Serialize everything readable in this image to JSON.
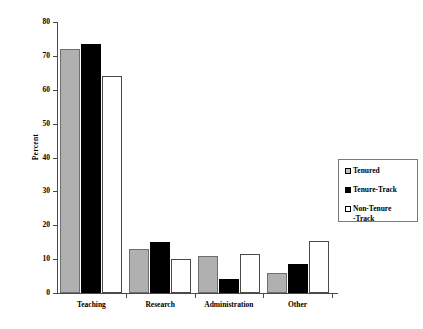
{
  "chart_data": {
    "type": "bar",
    "title": "",
    "xlabel": "",
    "ylabel": "Percent",
    "ylim": [
      0,
      80
    ],
    "yticks": [
      0,
      10,
      20,
      30,
      40,
      50,
      60,
      70,
      80
    ],
    "ytick_labels": [
      "0",
      "10",
      "20",
      "30",
      "40",
      "50",
      "60",
      "70",
      "80"
    ],
    "grid": false,
    "legend_position": "right",
    "categories": [
      "Teaching",
      "Research",
      "Administration",
      "Other"
    ],
    "series": [
      {
        "name": "Tenured",
        "legend_label": "Tenured",
        "color": "#b0b0b0",
        "values": [
          72,
          13,
          11,
          6
        ]
      },
      {
        "name": "Tenure-Track",
        "legend_label": "Tenure-Track",
        "color": "#000000",
        "values": [
          73.5,
          15,
          4,
          8.5
        ]
      },
      {
        "name": "Non-Tenure-Track",
        "legend_label": "Non-Tenure\n-Track",
        "color": "#ffffff",
        "values": [
          64,
          10,
          11.5,
          15.5
        ]
      }
    ]
  },
  "axis": {
    "ylabel": "Percent",
    "ymin": 0,
    "ymax": 80
  },
  "legend": {
    "items": [
      {
        "label": "Tenured",
        "swatch": "gray-filled-square-icon"
      },
      {
        "label": "Tenure-Track",
        "swatch": "black-filled-square-icon"
      },
      {
        "label": "Non-Tenure\n-Track",
        "swatch": "white-empty-square-icon"
      }
    ]
  }
}
